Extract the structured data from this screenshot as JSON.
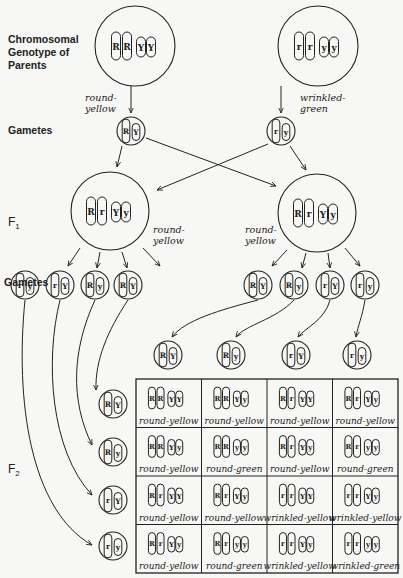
{
  "labels": {
    "parents": "Chromosomal Genotype of Parents",
    "parents_line1": "Chromosomal",
    "parents_line2": "Genotype of",
    "parents_line3": "Parents",
    "gametes_top": "Gametes",
    "f1": "F",
    "f1_sub": "1",
    "gametes_mid": "Gametes",
    "f2": "F",
    "f2_sub": "2"
  },
  "parents": [
    {
      "genotype": [
        "R",
        "R",
        "Y",
        "Y"
      ],
      "phenotype_l1": "round-",
      "phenotype_l2": "yellow",
      "gamete": [
        "R",
        "Y"
      ]
    },
    {
      "genotype": [
        "r",
        "r",
        "y",
        "y"
      ],
      "phenotype_l1": "wrinkled-",
      "phenotype_l2": "green",
      "gamete": [
        "r",
        "y"
      ]
    }
  ],
  "f1": [
    {
      "genotype": [
        "R",
        "r",
        "Y",
        "y"
      ],
      "phenotype_l1": "round-",
      "phenotype_l2": "yellow"
    },
    {
      "genotype": [
        "R",
        "r",
        "Y",
        "y"
      ],
      "phenotype_l1": "round-",
      "phenotype_l2": "yellow"
    }
  ],
  "f1_gametes_left": [
    [
      "r",
      "y"
    ],
    [
      "r",
      "Y"
    ],
    [
      "R",
      "y"
    ],
    [
      "R",
      "Y"
    ]
  ],
  "f1_gametes_right": [
    [
      "R",
      "Y"
    ],
    [
      "R",
      "y"
    ],
    [
      "r",
      "Y"
    ],
    [
      "r",
      "y"
    ]
  ],
  "punnett": {
    "col_gametes": [
      [
        "R",
        "Y"
      ],
      [
        "R",
        "y"
      ],
      [
        "r",
        "Y"
      ],
      [
        "r",
        "y"
      ]
    ],
    "row_gametes": [
      [
        "R",
        "Y"
      ],
      [
        "R",
        "y"
      ],
      [
        "r",
        "Y"
      ],
      [
        "r",
        "y"
      ]
    ],
    "cells": [
      [
        {
          "g": [
            "R",
            "R",
            "Y",
            "Y"
          ],
          "p": "round-yellow"
        },
        {
          "g": [
            "R",
            "R",
            "Y",
            "y"
          ],
          "p": "round-yellow"
        },
        {
          "g": [
            "R",
            "r",
            "Y",
            "Y"
          ],
          "p": "round-yellow"
        },
        {
          "g": [
            "R",
            "r",
            "Y",
            "y"
          ],
          "p": "round-yellow"
        }
      ],
      [
        {
          "g": [
            "R",
            "R",
            "Y",
            "y"
          ],
          "p": "round-yellow"
        },
        {
          "g": [
            "R",
            "R",
            "y",
            "y"
          ],
          "p": "round-green"
        },
        {
          "g": [
            "R",
            "r",
            "Y",
            "y"
          ],
          "p": "round-yellow"
        },
        {
          "g": [
            "R",
            "r",
            "y",
            "y"
          ],
          "p": "round-green"
        }
      ],
      [
        {
          "g": [
            "R",
            "r",
            "Y",
            "Y"
          ],
          "p": "round-yellow"
        },
        {
          "g": [
            "R",
            "r",
            "Y",
            "y"
          ],
          "p": "round-yellow"
        },
        {
          "g": [
            "r",
            "r",
            "Y",
            "Y"
          ],
          "p": "wrinkled-yellow"
        },
        {
          "g": [
            "r",
            "r",
            "Y",
            "y"
          ],
          "p": "wrinkled-yellow"
        }
      ],
      [
        {
          "g": [
            "R",
            "r",
            "Y",
            "y"
          ],
          "p": "round-yellow"
        },
        {
          "g": [
            "R",
            "r",
            "y",
            "y"
          ],
          "p": "round-green"
        },
        {
          "g": [
            "r",
            "r",
            "Y",
            "y"
          ],
          "p": "wrinkled-yellow"
        },
        {
          "g": [
            "r",
            "r",
            "y",
            "y"
          ],
          "p": "wrinkled-green"
        }
      ]
    ]
  },
  "colors": {
    "ink": "#222222",
    "paper": "#f7f7f5"
  }
}
